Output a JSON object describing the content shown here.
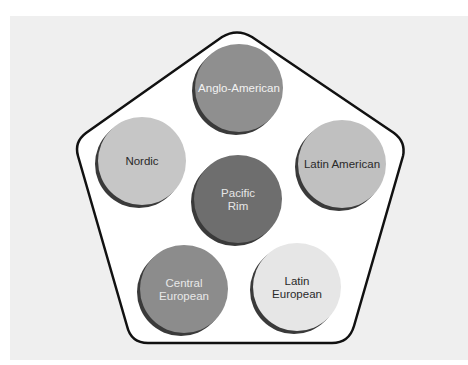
{
  "diagram": {
    "title": "",
    "container_shape": "pentagon",
    "colors": {
      "background_panel": "#efefef",
      "pentagon_fill": "#ffffff",
      "pentagon_stroke": "#111111",
      "shadow": "#3a3a3a"
    },
    "clusters": [
      {
        "id": "anglo-american",
        "lines": [
          "Anglo-American"
        ],
        "fill": "#8f8f8f",
        "text_color": "#f2f2f2"
      },
      {
        "id": "nordic",
        "lines": [
          "Nordic"
        ],
        "fill": "#c6c6c6",
        "text_color": "#2a2a2a"
      },
      {
        "id": "latin-american",
        "lines": [
          "Latin American"
        ],
        "fill": "#c0c0c0",
        "text_color": "#2a2a2a"
      },
      {
        "id": "pacific-rim",
        "lines": [
          "Pacific",
          "Rim"
        ],
        "fill": "#6e6e6e",
        "text_color": "#e6e6e6"
      },
      {
        "id": "central-european",
        "lines": [
          "Central",
          "European"
        ],
        "fill": "#8c8c8c",
        "text_color": "#e8e8e8"
      },
      {
        "id": "latin-european",
        "lines": [
          "Latin",
          "European"
        ],
        "fill": "#e6e6e6",
        "text_color": "#2a2a2a"
      }
    ]
  }
}
